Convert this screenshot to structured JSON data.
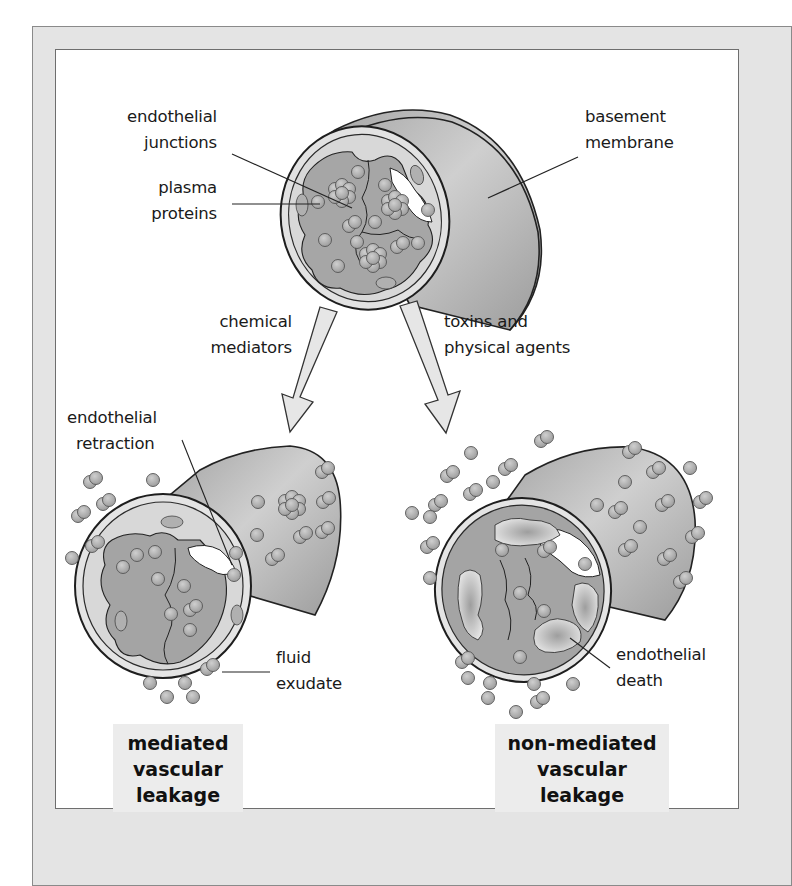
{
  "figure": {
    "top_vessel": {
      "labels": {
        "endothelial_junctions": [
          "endothelial",
          "junctions"
        ],
        "plasma_proteins": [
          "plasma",
          "proteins"
        ],
        "basement_membrane": [
          "basement",
          "membrane"
        ]
      }
    },
    "arrows": {
      "left": [
        "chemical",
        "mediators"
      ],
      "right": [
        "toxins and",
        "physical agents"
      ]
    },
    "left_vessel": {
      "labels": {
        "endothelial_retraction": [
          "endothelial",
          "retraction"
        ],
        "fluid_exudate": [
          "fluid",
          "exudate"
        ]
      },
      "caption": [
        "mediated",
        "vascular",
        "leakage"
      ]
    },
    "right_vessel": {
      "labels": {
        "endothelial_death": [
          "endothelial",
          "death"
        ]
      },
      "caption": [
        "non-mediated",
        "vascular",
        "leakage"
      ]
    },
    "colors": {
      "frame_bg": "#e4e4e4",
      "panel_bg": "#ffffff",
      "tube_fill": "#b4b4b4",
      "inner_fill": "#a6a6a6",
      "endothelium": "#dcdcdc",
      "sphere": "#b2b2b2",
      "arrow_fill": "#e6e6e6",
      "caption_bg": "#ececec"
    }
  }
}
